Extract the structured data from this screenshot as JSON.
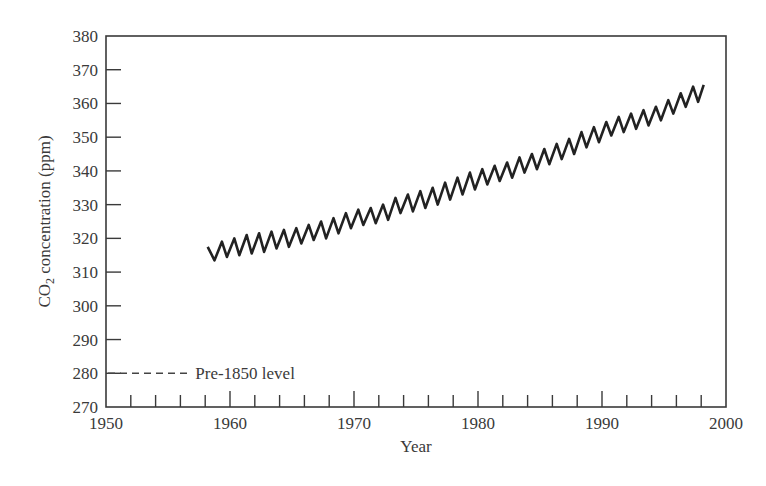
{
  "chart_data": {
    "type": "line",
    "title": "",
    "xlabel": "Year",
    "ylabel": "CO2 concentration (ppm)",
    "ylabel_parts": {
      "pre": "CO",
      "sub": "2",
      "post": " concentration (ppm)"
    },
    "xlim": [
      1950,
      2000
    ],
    "ylim": [
      270,
      380
    ],
    "x_ticks": [
      1950,
      1960,
      1970,
      1980,
      1990,
      2000
    ],
    "x_minor_step": 2,
    "y_ticks": [
      270,
      280,
      290,
      300,
      310,
      320,
      330,
      340,
      350,
      360,
      370,
      380
    ],
    "grid": false,
    "legend": null,
    "series": [
      {
        "name": "Atmospheric CO2 (seasonal cycle)",
        "style": "solid",
        "color": "#222222",
        "x": [
          1958.2,
          1958.75,
          1959.35,
          1959.75,
          1960.35,
          1960.75,
          1961.35,
          1961.75,
          1962.35,
          1962.75,
          1963.35,
          1963.75,
          1964.35,
          1964.75,
          1965.35,
          1965.75,
          1966.35,
          1966.75,
          1967.35,
          1967.75,
          1968.35,
          1968.75,
          1969.35,
          1969.75,
          1970.35,
          1970.75,
          1971.35,
          1971.75,
          1972.35,
          1972.75,
          1973.35,
          1973.75,
          1974.35,
          1974.75,
          1975.35,
          1975.75,
          1976.35,
          1976.75,
          1977.35,
          1977.75,
          1978.35,
          1978.75,
          1979.35,
          1979.75,
          1980.35,
          1980.75,
          1981.35,
          1981.75,
          1982.35,
          1982.75,
          1983.35,
          1983.75,
          1984.35,
          1984.75,
          1985.35,
          1985.75,
          1986.35,
          1986.75,
          1987.35,
          1987.75,
          1988.35,
          1988.75,
          1989.35,
          1989.75,
          1990.35,
          1990.75,
          1991.35,
          1991.75,
          1992.35,
          1992.75,
          1993.35,
          1993.75,
          1994.35,
          1994.75,
          1995.35,
          1995.75,
          1996.35,
          1996.75,
          1997.35,
          1997.75,
          1998.2
        ],
        "y": [
          317.5,
          313.5,
          319,
          314.5,
          320,
          315,
          321,
          315.5,
          321.5,
          316,
          322,
          317,
          322.5,
          317.5,
          323,
          318.5,
          324,
          319.5,
          325,
          320,
          326,
          321.5,
          327.5,
          323,
          328.5,
          324,
          329,
          324.5,
          330,
          325.5,
          332,
          327.5,
          333,
          328,
          334,
          329,
          335,
          330,
          336.5,
          331.5,
          338,
          333,
          339.5,
          334.5,
          340.5,
          336,
          341.5,
          337,
          342.5,
          338,
          344,
          339.5,
          345,
          340.5,
          346.5,
          342,
          348,
          343.5,
          349.5,
          345,
          351.5,
          347,
          353,
          348.5,
          354.5,
          350.5,
          356,
          351.5,
          357,
          352.5,
          358,
          353.5,
          359,
          355,
          361,
          357,
          363,
          359,
          365,
          360.5,
          365.5
        ]
      },
      {
        "name": "Pre-1850 level",
        "style": "dashed",
        "color": "#444444",
        "x": [
          1950,
          1956.8
        ],
        "y": [
          280,
          280
        ]
      }
    ],
    "annotations": [
      {
        "text": "Pre-1850 level",
        "x": 1957.2,
        "y": 280
      }
    ]
  }
}
